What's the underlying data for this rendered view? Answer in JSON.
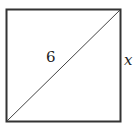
{
  "diagram": {
    "shape": "square",
    "diagonal_label": "6",
    "side_label": "x",
    "colors": {
      "stroke": "#333333",
      "background": "#ffffff"
    }
  }
}
